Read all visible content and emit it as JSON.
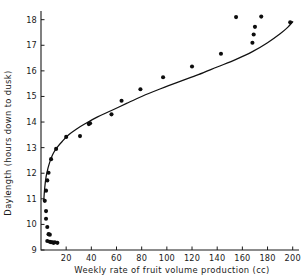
{
  "chart_data": {
    "type": "scatter",
    "title": "",
    "subtitle": "",
    "xlabel": "Weekly rate of fruit volume production (cc)",
    "ylabel": "Daylength (hours down to dusk)",
    "xlim": [
      0,
      205
    ],
    "ylim": [
      9,
      18.3
    ],
    "xticks": [
      20,
      40,
      60,
      80,
      100,
      120,
      140,
      160,
      180,
      200
    ],
    "yticks": [
      9,
      10,
      11,
      12,
      13,
      14,
      15,
      16,
      17,
      18
    ],
    "xtick_labels": [
      "20",
      "40",
      "60",
      "80",
      "100",
      "120",
      "140",
      "160",
      "180",
      "200"
    ],
    "ytick_labels": [
      "9",
      "10",
      "11",
      "12",
      "13",
      "14",
      "15",
      "16",
      "17",
      "18"
    ],
    "grid": false,
    "legend": null,
    "legend_position": "none",
    "marker": "filled-circle",
    "marker_color": "#0d0d0d",
    "curve_color": "#111111",
    "background_color": "#ffffff",
    "annotations": [],
    "series": [
      {
        "name": "observations",
        "type": "scatter",
        "points": [
          [
            5,
            9.35
          ],
          [
            7,
            9.32
          ],
          [
            8,
            9.3
          ],
          [
            9,
            9.3
          ],
          [
            10,
            9.28
          ],
          [
            11,
            9.3
          ],
          [
            13,
            9.28
          ],
          [
            6,
            9.62
          ],
          [
            7,
            9.6
          ],
          [
            5,
            9.9
          ],
          [
            4,
            10.22
          ],
          [
            4,
            10.52
          ],
          [
            3,
            10.92
          ],
          [
            4,
            11.32
          ],
          [
            5,
            11.72
          ],
          [
            6,
            12.02
          ],
          [
            8,
            12.55
          ],
          [
            12,
            12.95
          ],
          [
            20,
            13.42
          ],
          [
            31,
            13.45
          ],
          [
            38,
            13.92
          ],
          [
            39,
            13.95
          ],
          [
            56,
            14.3
          ],
          [
            64,
            14.83
          ],
          [
            79,
            15.28
          ],
          [
            97,
            15.75
          ],
          [
            120,
            16.17
          ],
          [
            143,
            16.67
          ],
          [
            155,
            18.1
          ],
          [
            168,
            17.1
          ],
          [
            169,
            17.42
          ],
          [
            170,
            17.72
          ],
          [
            175,
            18.12
          ],
          [
            198,
            17.9
          ]
        ]
      },
      {
        "name": "fitted-curve",
        "type": "line",
        "description": "smooth logarithmic fit rising from 11 h at low production to about 18 h at 200 cc",
        "points": [
          [
            2.2,
            10.95
          ],
          [
            3,
            11.45
          ],
          [
            4,
            11.85
          ],
          [
            5,
            12.08
          ],
          [
            6,
            12.28
          ],
          [
            8,
            12.58
          ],
          [
            10,
            12.8
          ],
          [
            13,
            13.02
          ],
          [
            17,
            13.25
          ],
          [
            22,
            13.5
          ],
          [
            28,
            13.72
          ],
          [
            35,
            13.93
          ],
          [
            45,
            14.2
          ],
          [
            56,
            14.45
          ],
          [
            68,
            14.73
          ],
          [
            80,
            15.0
          ],
          [
            95,
            15.3
          ],
          [
            110,
            15.58
          ],
          [
            125,
            15.85
          ],
          [
            140,
            16.15
          ],
          [
            155,
            16.45
          ],
          [
            168,
            16.75
          ],
          [
            180,
            17.1
          ],
          [
            190,
            17.45
          ],
          [
            196,
            17.7
          ],
          [
            200,
            17.92
          ]
        ]
      }
    ]
  }
}
